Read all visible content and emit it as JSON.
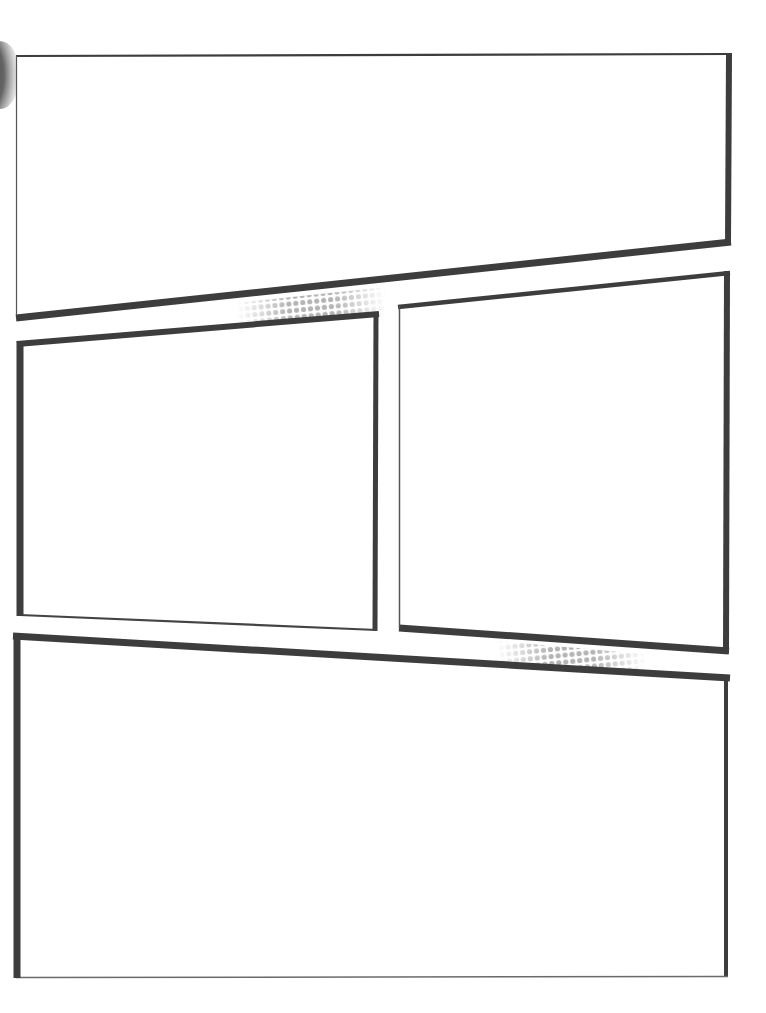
{
  "page": {
    "title": "Blank comic page template",
    "background": "#ffffff",
    "border_color": "#3d3d3d",
    "halftone_color": "#b8b8b8",
    "panel_count": 4
  },
  "panels": [
    {
      "id": "panel-1",
      "label": "Top wide panel (slanted bottom edge)",
      "text": ""
    },
    {
      "id": "panel-2",
      "label": "Middle left panel",
      "text": ""
    },
    {
      "id": "panel-3",
      "label": "Middle right panel",
      "text": ""
    },
    {
      "id": "panel-4",
      "label": "Bottom wide panel (slanted top edge)",
      "text": ""
    }
  ],
  "decorations": [
    {
      "id": "halftone-gutter-1",
      "label": "halftone dots between top and middle-left panels"
    },
    {
      "id": "halftone-gutter-2",
      "label": "halftone dots between middle-right and bottom panels"
    },
    {
      "id": "binding-shadow",
      "label": "dark scan shadow at top-left edge"
    }
  ]
}
